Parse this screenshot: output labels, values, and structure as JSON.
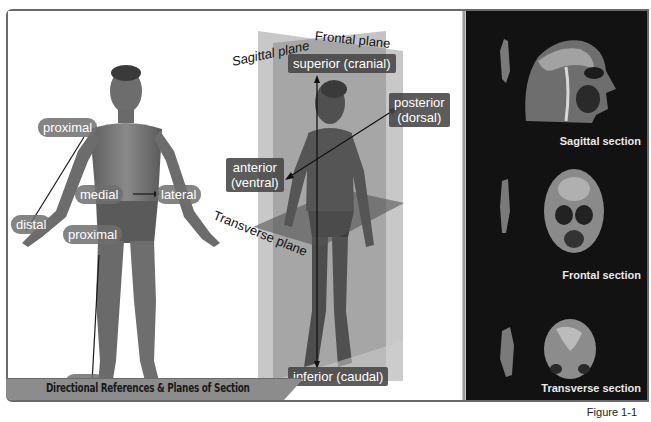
{
  "figure": {
    "title": "Directional References & Planes of Section",
    "caption": "Figure 1-1"
  },
  "left_figure": {
    "labels": {
      "proximal_arm": "proximal",
      "distal_arm": "distal",
      "medial": "medial",
      "lateral": "lateral",
      "proximal_leg": "proximal",
      "distal_leg": "distal"
    }
  },
  "center_figure": {
    "planes": {
      "frontal": "Frontal plane",
      "sagittal": "Sagittal plane",
      "transverse": "Transverse plane"
    },
    "labels": {
      "superior": "superior (cranial)",
      "inferior": "inferior (caudal)",
      "anterior_line1": "anterior",
      "anterior_line2": "(ventral)",
      "posterior_line1": "posterior",
      "posterior_line2": "(dorsal)"
    }
  },
  "sections": [
    {
      "label": "Sagittal section"
    },
    {
      "label": "Frontal section"
    },
    {
      "label": "Transverse section"
    }
  ],
  "colors": {
    "frame_border": "#6a6a6a",
    "right_panel_bg": "#121212",
    "label_pill": "#6e6e6e",
    "label_box": "#464646",
    "title_bar": "#8c8c8c"
  }
}
